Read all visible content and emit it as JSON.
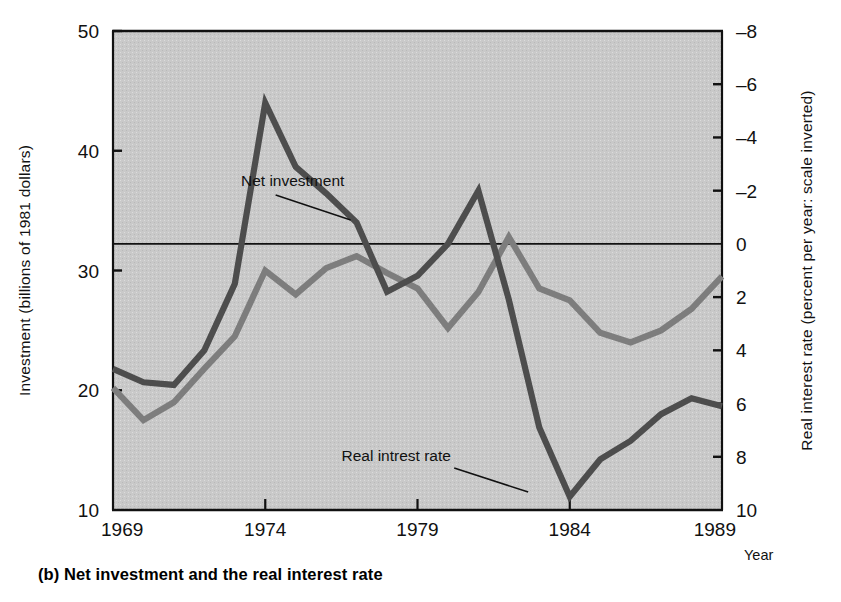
{
  "caption": "(b) Net investment and the real interest rate",
  "axes": {
    "left_title": "Investment (billions of 1981 dollars)",
    "right_title": "Real interest rate (percent per year: scale inverted)",
    "x_axis_name": "Year",
    "left_ticks": [
      "50",
      "40",
      "30",
      "20",
      "10"
    ],
    "left_tick_values": [
      50,
      40,
      30,
      20,
      10
    ],
    "right_ticks": [
      "–8",
      "–6",
      "–4",
      "–2",
      "0",
      "2",
      "4",
      "6",
      "8",
      "10"
    ],
    "right_tick_values": [
      -8,
      -6,
      -4,
      -2,
      0,
      2,
      4,
      6,
      8,
      10
    ],
    "x_ticks": [
      "1969",
      "1974",
      "1979",
      "1984",
      "1989"
    ],
    "x_tick_values": [
      1969,
      1974,
      1979,
      1984,
      1989
    ]
  },
  "annotations": [
    {
      "text": "Net investment",
      "x": 1974.9,
      "y_px": 186
    },
    {
      "text": "Real intrest rate",
      "x": 1978.3,
      "y_px": 461
    }
  ],
  "colors": {
    "plot_background": "#c9c9c9",
    "net_investment_line": "#7d7d7d",
    "real_interest_line": "#4d4d4d",
    "axis": "#111111",
    "zero_line": "#111111",
    "page_background": "#ffffff"
  },
  "chart_data": {
    "type": "line",
    "title": "(b) Net investment and the real interest rate",
    "xlabel": "Year",
    "ylabel": "Investment (billions of 1981 dollars)",
    "y2label": "Real interest rate (percent per year: scale inverted)",
    "xlim": [
      1969,
      1989
    ],
    "ylim": [
      10,
      50
    ],
    "y2lim": [
      10,
      -8
    ],
    "y2_inverted": true,
    "grid": false,
    "legend": "inline-annotations",
    "zero_line_right_axis": 0,
    "x": [
      1969,
      1970,
      1971,
      1972,
      1973,
      1974,
      1975,
      1976,
      1977,
      1978,
      1979,
      1980,
      1981,
      1982,
      1983,
      1984,
      1985,
      1986,
      1987,
      1988,
      1989
    ],
    "series": [
      {
        "name": "Net investment",
        "axis": "left",
        "units": "billions of 1981 dollars",
        "color": "#7d7d7d",
        "values": [
          20.2,
          17.5,
          19.0,
          21.8,
          24.5,
          30.0,
          28.0,
          30.2,
          31.2,
          29.8,
          28.5,
          25.2,
          28.2,
          32.8,
          28.5,
          27.5,
          24.8,
          24.0,
          25.0,
          26.8,
          29.5
        ]
      },
      {
        "name": "Real intrest rate",
        "axis": "right",
        "units": "percent per year (scale inverted)",
        "color": "#4d4d4d",
        "values_right_axis": [
          4.7,
          5.2,
          5.3,
          4.0,
          1.5,
          -5.3,
          -2.9,
          -1.9,
          -0.8,
          1.8,
          1.2,
          0.0,
          -2.0,
          2.1,
          6.9,
          9.5,
          8.1,
          7.4,
          6.4,
          5.8,
          6.1
        ],
        "values_left_axis_px": [
          25.4,
          24.6,
          24.3,
          27.9,
          35.6,
          47.7,
          40.6,
          36.9,
          33.7,
          26.9,
          28.6,
          32.7,
          37.7,
          25.3,
          16.1,
          11.2,
          13.3,
          14.8,
          17.2,
          18.7,
          17.8
        ]
      }
    ],
    "net_investment_points_left_axis": [
      20.2,
      17.5,
      19.0,
      21.8,
      24.5,
      30.0,
      28.0,
      30.2,
      31.2,
      29.8,
      28.5,
      25.2,
      28.2,
      32.8,
      28.5,
      27.5,
      24.8,
      24.0,
      25.0,
      26.8,
      29.5
    ]
  },
  "derived_plot": {
    "net_investment_left_values": [
      20.2,
      17.5,
      19.0,
      21.8,
      24.5,
      30.0,
      28.0,
      30.2,
      31.2,
      29.8,
      28.5,
      25.2,
      28.2,
      32.8,
      28.5,
      27.5,
      24.8,
      24.0,
      25.0,
      26.8,
      29.5
    ],
    "net_investment_actual_plotted": [
      20.2,
      17.5,
      19.0,
      21.8,
      24.5,
      30.0,
      28.0,
      30.2,
      31.2,
      29.8,
      28.5,
      25.2,
      28.2,
      32.8,
      28.5,
      27.5,
      24.8,
      24.0,
      25.0,
      26.8,
      29.5
    ],
    "real_rate_plotted_left_scale": [
      25.4,
      24.6,
      24.3,
      27.9,
      35.6,
      47.7,
      40.6,
      36.9,
      33.7,
      26.9,
      28.6,
      32.7,
      37.7,
      25.3,
      16.1,
      11.2,
      13.3,
      14.8,
      17.2,
      18.7,
      17.8
    ]
  }
}
